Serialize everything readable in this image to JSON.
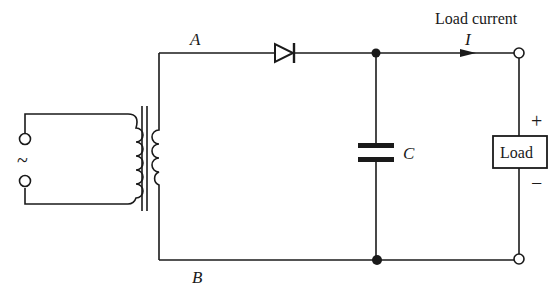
{
  "diagram": {
    "labels": {
      "node_a": "A",
      "node_b": "B",
      "capacitor": "C",
      "current_symbol": "I",
      "current_caption": "Load current",
      "load": "Load",
      "plus": "+",
      "minus": "−",
      "ac_source": "~"
    },
    "components": [
      {
        "type": "ac-source",
        "name": "ac-input"
      },
      {
        "type": "transformer",
        "name": "transformer"
      },
      {
        "type": "diode",
        "name": "diode"
      },
      {
        "type": "capacitor",
        "name": "C"
      },
      {
        "type": "load",
        "name": "Load"
      }
    ],
    "colors": {
      "line": "#1a1a1a",
      "background": "#ffffff"
    }
  }
}
